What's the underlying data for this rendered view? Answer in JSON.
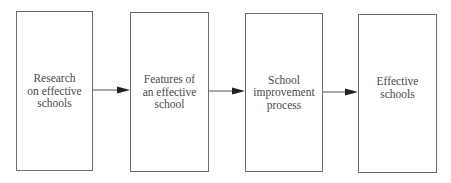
{
  "diagram": {
    "type": "flowchart",
    "direction": "left-to-right",
    "colors": {
      "stroke": "#6e6e6e",
      "text": "#4a4a4a",
      "arrowhead": "#222222",
      "background": "#ffffff"
    },
    "nodes": [
      {
        "id": "research",
        "lines": [
          "Research",
          "on effective",
          "schools"
        ]
      },
      {
        "id": "features",
        "lines": [
          "Features of",
          "an effective",
          "school"
        ]
      },
      {
        "id": "improvement",
        "lines": [
          "School",
          "improvement",
          "process"
        ]
      },
      {
        "id": "effective",
        "lines": [
          "Effective",
          "schools"
        ]
      }
    ],
    "edges": [
      {
        "from": "research",
        "to": "features"
      },
      {
        "from": "features",
        "to": "improvement"
      },
      {
        "from": "improvement",
        "to": "effective"
      }
    ]
  }
}
